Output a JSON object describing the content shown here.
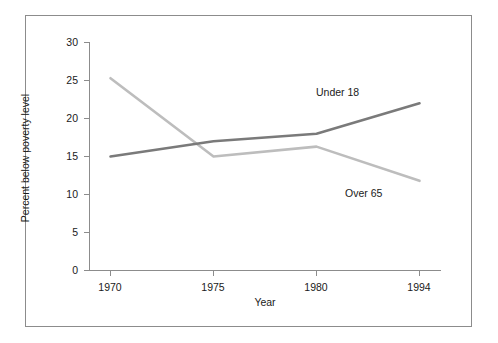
{
  "chart_data": {
    "type": "line",
    "title": "",
    "xlabel": "Year",
    "ylabel": "Percent below poverty level",
    "categories": [
      "1970",
      "1975",
      "1980",
      "1994"
    ],
    "x_tick_labels": [
      "1970",
      "1975",
      "1980",
      "1994"
    ],
    "y_tick_labels": [
      "0",
      "5",
      "10",
      "15",
      "20",
      "25",
      "30"
    ],
    "y_ticks": [
      0,
      5,
      10,
      15,
      20,
      25,
      30
    ],
    "ylim": [
      0,
      30
    ],
    "grid": false,
    "legend_position": "inline-labels",
    "series": [
      {
        "name": "Under 18",
        "label": "Under 18",
        "color": "#7a7a7a",
        "values": [
          15.0,
          17.0,
          18.0,
          22.0
        ]
      },
      {
        "name": "Over 65",
        "label": "Over 65",
        "color": "#bdbdbd",
        "values": [
          25.3,
          15.0,
          16.3,
          11.8
        ]
      }
    ]
  },
  "axis": {
    "line_color": "#8c8c8c",
    "frame_color": "#8c8c8c"
  }
}
